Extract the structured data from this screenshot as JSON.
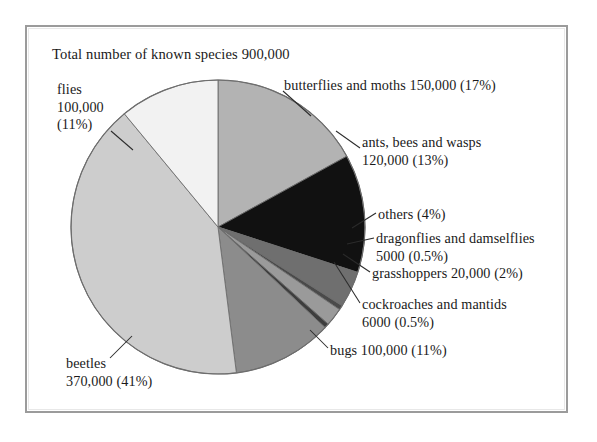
{
  "page": {
    "title": "Total number of known species 900,000",
    "frame_color": "#9b9b9b",
    "background": "#ffffff"
  },
  "chart_data": {
    "type": "pie",
    "title": "Total number of known species 900,000",
    "total": "900,000",
    "total_value": 900000,
    "legend_position": "callout-labels",
    "grid": false,
    "start_angle_deg": -90,
    "direction": "clockwise",
    "categories": [
      "butterflies and moths",
      "ants, bees and wasps",
      "others",
      "dragonflies and damselflies",
      "grasshoppers",
      "cockroaches and mantids",
      "bugs",
      "beetles",
      "flies"
    ],
    "values": [
      150000,
      120000,
      36000,
      5000,
      20000,
      6000,
      100000,
      370000,
      100000
    ],
    "percents": [
      17,
      13,
      4,
      0.5,
      2,
      0.5,
      11,
      41,
      11
    ],
    "colors": [
      "#b3b3b3",
      "#111111",
      "#6f6f6f",
      "#4a4a4a",
      "#9a9a9a",
      "#3d3d3d",
      "#8c8c8c",
      "#cdcdcd",
      "#f2f2f2"
    ],
    "slices": [
      {
        "name": "butterflies and moths",
        "value": 150000,
        "value_text": "150,000",
        "percent": 17,
        "percent_text": "17%",
        "color": "#b3b3b3"
      },
      {
        "name": "ants, bees and wasps",
        "value": 120000,
        "value_text": "120,000",
        "percent": 13,
        "percent_text": "13%",
        "color": "#111111"
      },
      {
        "name": "others",
        "value": 36000,
        "value_text": "",
        "percent": 4,
        "percent_text": "4%",
        "color": "#6f6f6f"
      },
      {
        "name": "dragonflies and damselflies",
        "value": 5000,
        "value_text": "5000",
        "percent": 0.5,
        "percent_text": "0.5%",
        "color": "#4a4a4a"
      },
      {
        "name": "grasshoppers",
        "value": 20000,
        "value_text": "20,000",
        "percent": 2,
        "percent_text": "2%",
        "color": "#9a9a9a"
      },
      {
        "name": "cockroaches and mantids",
        "value": 6000,
        "value_text": "6000",
        "percent": 0.5,
        "percent_text": "0.5%",
        "color": "#3d3d3d"
      },
      {
        "name": "bugs",
        "value": 100000,
        "value_text": "100,000",
        "percent": 11,
        "percent_text": "11%",
        "color": "#8c8c8c"
      },
      {
        "name": "beetles",
        "value": 370000,
        "value_text": "370,000",
        "percent": 41,
        "percent_text": "41%",
        "color": "#cdcdcd"
      },
      {
        "name": "flies",
        "value": 100000,
        "value_text": "100,000",
        "percent": 11,
        "percent_text": "11%",
        "color": "#f2f2f2"
      }
    ]
  },
  "labels": {
    "flies": "flies\n100,000\n(11%)",
    "butterflies": "butterflies and moths 150,000 (17%)",
    "ants": "ants, bees and wasps\n120,000 (13%)",
    "others": "others (4%)",
    "dragonflies": "dragonflies and damselflies\n5000 (0.5%)",
    "grasshoppers": "grasshoppers 20,000 (2%)",
    "cockroaches": "cockroaches and mantids\n6000 (0.5%)",
    "bugs": "bugs 100,000 (11%)",
    "beetles": "beetles\n370,000 (41%)"
  }
}
